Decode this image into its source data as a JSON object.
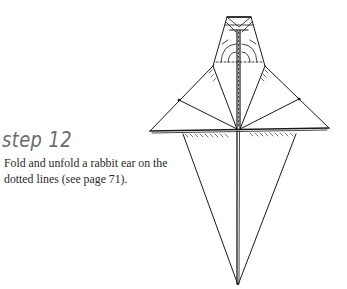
{
  "step": {
    "title": "step 12",
    "instructions": "Fold and unfold a rabbit ear on the dotted lines (see page 71)."
  },
  "diagram": {
    "line_color": "#1a1a1a"
  }
}
